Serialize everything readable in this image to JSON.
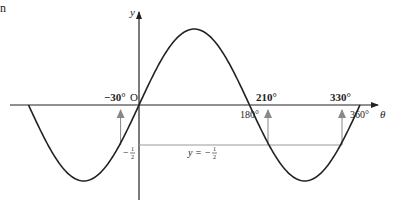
{
  "figure": {
    "corner_fragment": "n",
    "axes": {
      "x_label": "θ",
      "y_label": "y",
      "origin_label": "O"
    },
    "curve": "y = sin θ",
    "domain_deg": [
      -180,
      360
    ],
    "tick_labels": {
      "t180": "180°",
      "t360": "360°"
    },
    "solutions": {
      "s1": "−30°",
      "s2": "210°",
      "s3": "330°"
    },
    "line_label": "y = −",
    "half": {
      "num": "1",
      "den": "2"
    },
    "y_tick_label": "−"
  },
  "colors": {
    "curve": "#222222",
    "axis": "#222222",
    "guide": "#999999"
  }
}
